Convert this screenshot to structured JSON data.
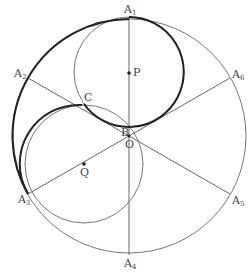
{
  "diagram": {
    "type": "geometry",
    "points": {
      "A1": {
        "label": "A",
        "sub": "1"
      },
      "A2": {
        "label": "A",
        "sub": "2"
      },
      "A3": {
        "label": "A",
        "sub": "3"
      },
      "A4": {
        "label": "A",
        "sub": "4"
      },
      "A5": {
        "label": "A",
        "sub": "5"
      },
      "A6": {
        "label": "A",
        "sub": "6"
      },
      "P": {
        "label": "P"
      },
      "Q": {
        "label": "Q"
      },
      "O": {
        "label": "O"
      },
      "B": {
        "label": "B"
      },
      "C": {
        "label": "C"
      }
    },
    "colors": {
      "thin_line": "#555555",
      "bold_line": "#222222",
      "label": "#444444"
    }
  }
}
